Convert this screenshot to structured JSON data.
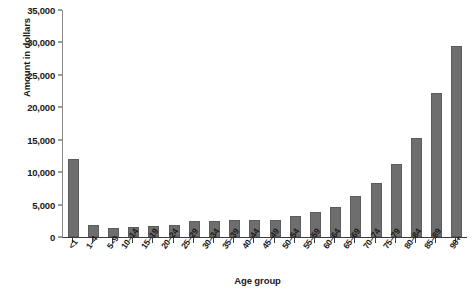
{
  "chart_data": {
    "type": "bar",
    "title": "",
    "xlabel": "Age group",
    "ylabel": "Amount in dollars",
    "ylim": [
      0,
      35000
    ],
    "yticks": [
      0,
      5000,
      10000,
      15000,
      20000,
      25000,
      30000,
      35000
    ],
    "ytick_labels": [
      "0",
      "5,000",
      "10,000",
      "15,000",
      "20,000",
      "25,000",
      "30,000",
      "35,000"
    ],
    "grid": false,
    "legend": "none",
    "bar_color": "#6e6e6e",
    "categories": [
      "<1",
      "1–4",
      "5–9",
      "10–14",
      "15–19",
      "20–24",
      "25–29",
      "30–34",
      "35–39",
      "40–44",
      "45–49",
      "50–54",
      "55–59",
      "60–64",
      "65–69",
      "70–74",
      "75–79",
      "80–84",
      "85–89",
      "90+"
    ],
    "values": [
      12100,
      1800,
      1450,
      1550,
      1650,
      1800,
      2400,
      2500,
      2550,
      2600,
      2700,
      3200,
      3800,
      4600,
      6300,
      8300,
      11200,
      15200,
      22200,
      29500
    ]
  }
}
